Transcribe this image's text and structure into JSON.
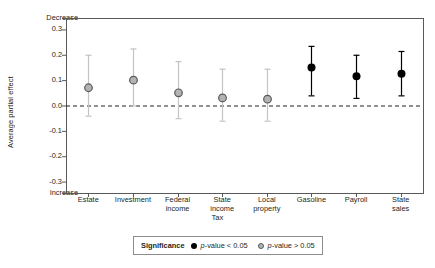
{
  "chart_data": {
    "type": "scatter",
    "title": "",
    "xlabel": "Tax",
    "ylabel": "Average partial effect",
    "ylim": [
      -0.345,
      0.345
    ],
    "yticks": [
      0.3,
      0.2,
      0.1,
      0.0,
      -0.1,
      -0.2,
      -0.3
    ],
    "ytick_labels": [
      "0.3",
      "0.2",
      "0.1",
      "0.0",
      "-0.1",
      "-0.2",
      "-0.3"
    ],
    "axis_end_labels": {
      "top": "Decrease",
      "bottom": "Increase"
    },
    "grid": false,
    "zero_reference_line": 0.0,
    "categories": [
      "Estate",
      "Investment",
      "Federal income",
      "State income",
      "Local property",
      "Gasoline",
      "Payroll",
      "State sales"
    ],
    "category_label_lines": [
      [
        "Estate"
      ],
      [
        "Investment"
      ],
      [
        "Federal",
        "income"
      ],
      [
        "State",
        "income"
      ],
      [
        "Local",
        "property"
      ],
      [
        "Gasoline"
      ],
      [
        "Payroll"
      ],
      [
        "State",
        "sales"
      ]
    ],
    "points": [
      {
        "category": "Estate",
        "value": 0.07,
        "ci_low": -0.04,
        "ci_high": 0.2,
        "significant": false
      },
      {
        "category": "Investment",
        "value": 0.1,
        "ci_low": 0.0,
        "ci_high": 0.225,
        "significant": false
      },
      {
        "category": "Federal income",
        "value": 0.05,
        "ci_low": -0.05,
        "ci_high": 0.175,
        "significant": false
      },
      {
        "category": "State income",
        "value": 0.03,
        "ci_low": -0.06,
        "ci_high": 0.145,
        "significant": false
      },
      {
        "category": "Local property",
        "value": 0.025,
        "ci_low": -0.06,
        "ci_high": 0.145,
        "significant": false
      },
      {
        "category": "Gasoline",
        "value": 0.15,
        "ci_low": 0.04,
        "ci_high": 0.235,
        "significant": true
      },
      {
        "category": "Payroll",
        "value": 0.115,
        "ci_low": 0.03,
        "ci_high": 0.2,
        "significant": true
      },
      {
        "category": "State sales",
        "value": 0.125,
        "ci_low": 0.04,
        "ci_high": 0.215,
        "significant": true
      }
    ],
    "legend": {
      "position": "bottom",
      "title": "Significance",
      "entries": [
        {
          "marker": "filled-circle",
          "label_pre": "p",
          "label_post": "-value < 0.05"
        },
        {
          "marker": "open-circle",
          "label_pre": "p",
          "label_post": "-value > 0.05"
        }
      ]
    },
    "colors": {
      "significant_marker": "#000000",
      "nonsignificant_marker_fill": "#b3b3b3",
      "nonsignificant_marker_edge": "#58595b",
      "significant_error_bar": "#000000",
      "nonsignificant_error_bar": "#c4c4c4",
      "axis": "#58595b",
      "zero_line": "#231f20",
      "text": "#231f20",
      "legend_border": "#8c8c8c"
    }
  }
}
